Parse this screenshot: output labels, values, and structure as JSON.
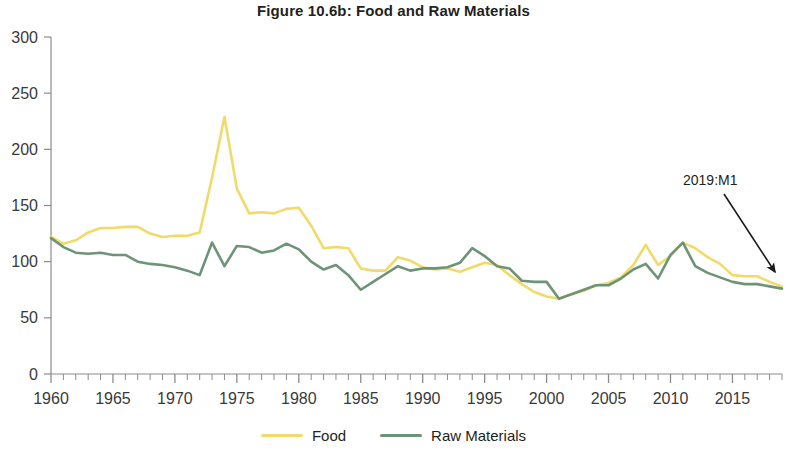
{
  "figure": {
    "title": "Figure 10.6b: Food and Raw Materials"
  },
  "legend": {
    "items": [
      {
        "label": "Food",
        "color": "#f2da6a",
        "name": "legend-item-food"
      },
      {
        "label": "Raw Materials",
        "color": "#6d9477",
        "name": "legend-item-raw-materials"
      }
    ]
  },
  "annotations": [
    {
      "text": "2019:M1",
      "name": "annotation-2019-m1"
    }
  ],
  "chart_data": {
    "type": "line",
    "title": "Figure 10.6b: Food and Raw Materials",
    "xlabel": "",
    "ylabel": "",
    "xlim": [
      1960,
      2019
    ],
    "ylim": [
      0,
      300
    ],
    "grid": false,
    "legend_position": "bottom",
    "y_ticks": [
      0,
      50,
      100,
      150,
      200,
      250,
      300
    ],
    "x_ticks": [
      1960,
      1965,
      1970,
      1975,
      1980,
      1985,
      1990,
      1995,
      2000,
      2005,
      2010,
      2015
    ],
    "x_minor_tick_interval": 1,
    "x": [
      1960,
      1961,
      1962,
      1963,
      1964,
      1965,
      1966,
      1967,
      1968,
      1969,
      1970,
      1971,
      1972,
      1973,
      1974,
      1975,
      1976,
      1977,
      1978,
      1979,
      1980,
      1981,
      1982,
      1983,
      1984,
      1985,
      1986,
      1987,
      1988,
      1989,
      1990,
      1991,
      1992,
      1993,
      1994,
      1995,
      1996,
      1997,
      1998,
      1999,
      2000,
      2001,
      2002,
      2003,
      2004,
      2005,
      2006,
      2007,
      2008,
      2009,
      2010,
      2011,
      2012,
      2013,
      2014,
      2015,
      2016,
      2017,
      2018,
      2019
    ],
    "series": [
      {
        "name": "Food",
        "color": "#f2da6a",
        "values": [
          122,
          116,
          119,
          126,
          130,
          130,
          131,
          131,
          125,
          122,
          123,
          123,
          126,
          175,
          229,
          165,
          143,
          144,
          143,
          147,
          148,
          132,
          112,
          113,
          112,
          94,
          92,
          92,
          104,
          101,
          95,
          93,
          94,
          91,
          95,
          99,
          97,
          88,
          80,
          73,
          69,
          67,
          71,
          74,
          79,
          81,
          86,
          97,
          115,
          97,
          105,
          117,
          112,
          104,
          98,
          88,
          87,
          87,
          82,
          78
        ],
        "annotation": {
          "text": "2019:M1",
          "x": 2019,
          "y": 78
        }
      },
      {
        "name": "Raw Materials",
        "color": "#6d9477",
        "values": [
          121,
          113,
          108,
          107,
          108,
          106,
          106,
          100,
          98,
          97,
          95,
          92,
          88,
          117,
          96,
          114,
          113,
          108,
          110,
          116,
          111,
          100,
          93,
          97,
          88,
          75,
          82,
          89,
          96,
          92,
          94,
          94,
          95,
          99,
          112,
          105,
          96,
          94,
          83,
          82,
          82,
          67,
          71,
          75,
          79,
          79,
          85,
          93,
          98,
          85,
          106,
          117,
          96,
          90,
          86,
          82,
          80,
          80,
          78,
          76
        ],
        "annotation": {
          "text": "2019:M1",
          "x": 2019,
          "y": 76
        }
      }
    ]
  }
}
